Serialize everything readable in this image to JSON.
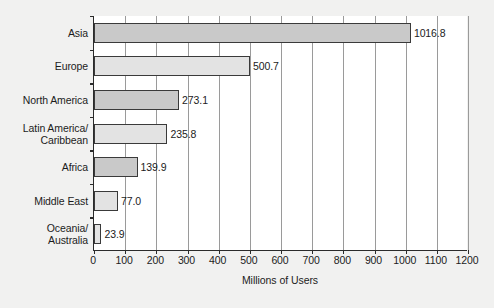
{
  "chart_data": {
    "type": "bar",
    "orientation": "horizontal",
    "title": "",
    "subtitle": "",
    "xlabel": "Millions of Users",
    "ylabel": "",
    "xlim": [
      0,
      1200
    ],
    "xticks": [
      0,
      100,
      200,
      300,
      400,
      500,
      600,
      700,
      800,
      900,
      1000,
      1100,
      1200
    ],
    "xticklabels": [
      "0",
      "100",
      "200",
      "300",
      "400",
      "500",
      "600",
      "700",
      "800",
      "900",
      "1000",
      "1100",
      "1200"
    ],
    "grid": "vertical",
    "legend": null,
    "categories": [
      "Asia",
      "Europe",
      "North America",
      "Latin America/\nCaribbean",
      "Africa",
      "Middle East",
      "Oceania/\nAustralia"
    ],
    "values": [
      1016.8,
      500.7,
      273.1,
      235.8,
      139.9,
      77.0,
      23.9
    ],
    "value_labels": [
      "1016.8",
      "500.7",
      "273.1",
      "235.8",
      "139.9",
      "77.0",
      "23.9"
    ],
    "bar_shades": [
      "dark",
      "light",
      "dark",
      "light",
      "dark",
      "light",
      "light"
    ],
    "colors": {
      "background": "#f1f1f0",
      "plot_background": "#ffffff",
      "bar_dark": "#c9c9c9",
      "bar_light": "#e3e3e3",
      "bar_edge": "#3a3a3a",
      "axis": "#2b2b2b",
      "gridline": "#9a9a9a",
      "text": "#1c1c1c"
    }
  }
}
